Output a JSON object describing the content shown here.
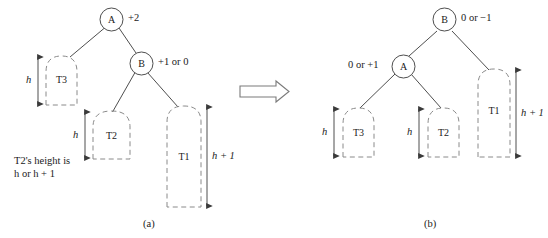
{
  "figure": {
    "colors": {
      "stroke": "#3a3a3a",
      "dashed_stroke": "#8a8a8a",
      "text": "#1a1a1a",
      "background": "#ffffff",
      "arrow_fill": "#ffffff",
      "arrow_stroke": "#7a7a7a"
    }
  },
  "panel_a": {
    "caption": "(a)",
    "nodes": [
      {
        "id": "node-a",
        "label": "A",
        "balance_label": "+2"
      },
      {
        "id": "node-b",
        "label": "B",
        "balance_label": "+1 or 0"
      }
    ],
    "subtrees": [
      {
        "id": "subtree-t3",
        "label": "T3",
        "height_label": "h"
      },
      {
        "id": "subtree-t2",
        "label": "T2",
        "height_label": "h"
      },
      {
        "id": "subtree-t1",
        "label": "T1",
        "height_label": "h + 1"
      }
    ],
    "note": "T2's height is\nh or h + 1"
  },
  "transform_arrow": {
    "name": "rotation-arrow",
    "direction": "right"
  },
  "panel_b": {
    "caption": "(b)",
    "nodes": [
      {
        "id": "node-b",
        "label": "B",
        "balance_label": "0 or −1"
      },
      {
        "id": "node-a",
        "label": "A",
        "balance_label": "0 or +1"
      }
    ],
    "subtrees": [
      {
        "id": "subtree-t3",
        "label": "T3",
        "height_label": "h"
      },
      {
        "id": "subtree-t2",
        "label": "T2",
        "height_label": "h"
      },
      {
        "id": "subtree-t1",
        "label": "T1",
        "height_label": "h + 1"
      }
    ]
  }
}
